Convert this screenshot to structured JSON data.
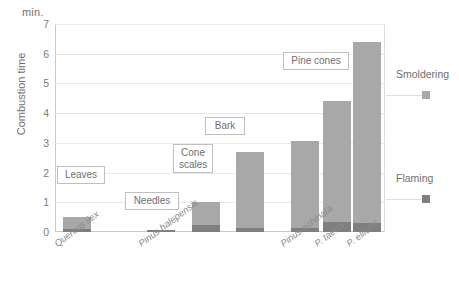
{
  "chart_data": {
    "type": "bar",
    "title": "",
    "subtitle": "",
    "unit_label": "min.",
    "ylabel": "Combustion time",
    "xlabel": "",
    "ylim": [
      0,
      7
    ],
    "yticks": [
      0,
      1,
      2,
      3,
      4,
      5,
      6,
      7
    ],
    "grid": true,
    "stacked": true,
    "legend_position": "right",
    "categories": [
      "Quercus ilex",
      "Pinus halepensis",
      "Pinus halepensis",
      "Pinus halepensis",
      "Pinus echinata",
      "P. taeda",
      "P. elliottii"
    ],
    "axis_tick_labels": [
      "Quercus ilex",
      "Pinus halepensis",
      "Pinus echinata",
      "P. taeda",
      "P. elliottii"
    ],
    "series": [
      {
        "name": "Flaming",
        "color": "#7f7f7f",
        "values": [
          0.1,
          0.07,
          0.25,
          0.15,
          0.12,
          0.35,
          0.3
        ]
      },
      {
        "name": "Smoldering",
        "color": "#a8a8a8",
        "values": [
          0.4,
          0.0,
          0.75,
          2.55,
          2.93,
          4.05,
          6.1
        ]
      }
    ],
    "totals": [
      0.5,
      0.07,
      1.0,
      2.7,
      3.05,
      4.4,
      6.4
    ],
    "annotations": [
      {
        "text": "Leaves",
        "bar_index": 0
      },
      {
        "text": "Needles",
        "bar_index": 1
      },
      {
        "text": "Cone\nscales",
        "bar_index": 2
      },
      {
        "text": "Bark",
        "bar_index": 3
      },
      {
        "text": "Pine cones",
        "bar_index": 6
      }
    ],
    "legend": [
      {
        "label": "Smoldering",
        "color": "#a8a8a8"
      },
      {
        "label": "Flaming",
        "color": "#7f7f7f"
      }
    ]
  }
}
